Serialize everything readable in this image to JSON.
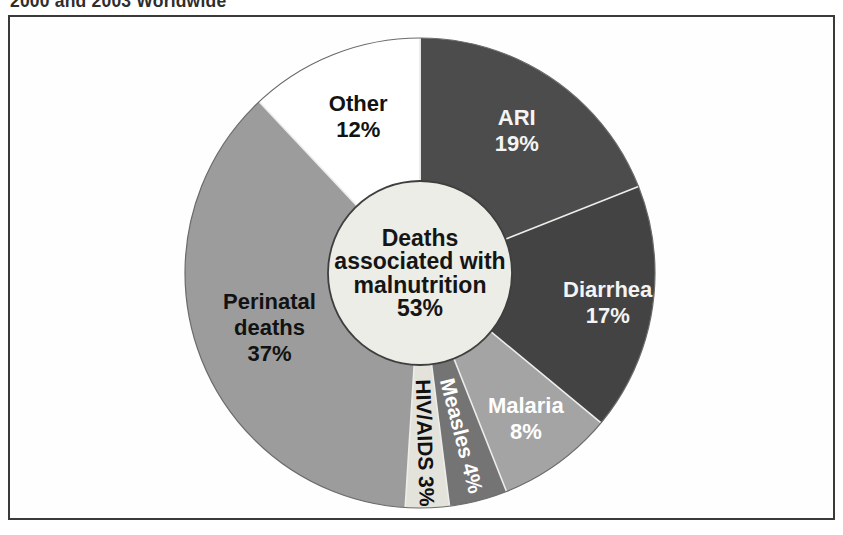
{
  "caption": "2000 and 2003 Worldwide",
  "chart_data": {
    "type": "pie",
    "direction": "clockwise",
    "start_angle_deg": 0,
    "unit": "%",
    "title": "2000 and 2003 Worldwide",
    "center_label": {
      "lines": [
        "Deaths",
        "associated with",
        "malnutrition",
        "53%"
      ],
      "color": "#151515"
    },
    "slices": [
      {
        "label": "ARI",
        "value": 19,
        "display": "19%",
        "lines": [
          "ARI",
          "19%"
        ],
        "color": "#4c4c4c",
        "text_color": "#f4f4f4",
        "rotated": false,
        "label_r": 172
      },
      {
        "label": "Diarrhea",
        "value": 17,
        "display": "17%",
        "lines": [
          "Diarrhea",
          "17%"
        ],
        "color": "#434343",
        "text_color": "#f4f4f4",
        "rotated": false,
        "label_r": 190
      },
      {
        "label": "Malaria",
        "value": 8,
        "display": "8%",
        "lines": [
          "Malaria",
          "8%"
        ],
        "color": "#a4a4a4",
        "text_color": "#ffffff",
        "rotated": false,
        "label_r": 180
      },
      {
        "label": "Measles",
        "value": 4,
        "display": "4%",
        "lines": [
          "Measles 4%"
        ],
        "color": "#747474",
        "text_color": "#ffffff",
        "rotated": true,
        "label_r": 168
      },
      {
        "label": "HIV/AIDS",
        "value": 3,
        "display": "3%",
        "lines": [
          "HIV/AIDS 3%"
        ],
        "color": "#e3e3dc",
        "text_color": "#111111",
        "rotated": true,
        "label_r": 170
      },
      {
        "label": "Perinatal deaths",
        "value": 37,
        "display": "37%",
        "lines": [
          "Perinatal",
          "deaths",
          "37%"
        ],
        "color": "#9c9c9c",
        "text_color": "#121212",
        "rotated": false,
        "label_r": 160
      },
      {
        "label": "Other",
        "value": 12,
        "display": "12%",
        "lines": [
          "Other",
          "12%"
        ],
        "color": "#ffffff",
        "text_color": "#121212",
        "rotated": false,
        "label_r": 168
      }
    ],
    "hole": {
      "fill": "#ebede6",
      "stroke": "#3f3f3f"
    },
    "outline": "#6a6a6a",
    "separator": "#ededea",
    "geometry": {
      "cx": 270,
      "cy": 253,
      "r": 235,
      "hole_r": 92
    }
  }
}
